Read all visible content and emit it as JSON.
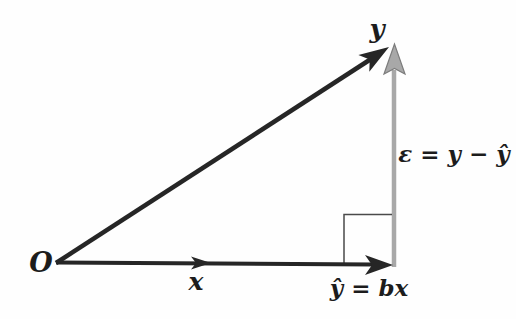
{
  "figure": {
    "type": "vector-projection-diagram",
    "background": "#fefefe",
    "colors": {
      "vector_black": "#262626",
      "vector_gray_fill": "#a8a8a8",
      "vector_gray_edge": "#7c7c7c",
      "right_angle": "#4a4a4a",
      "label": "#1c1c1c"
    },
    "labels": {
      "origin": "O",
      "y_vector": "y",
      "x_vector": "x",
      "projection": "ŷ = bx",
      "residual": "ε = y − ŷ"
    }
  }
}
